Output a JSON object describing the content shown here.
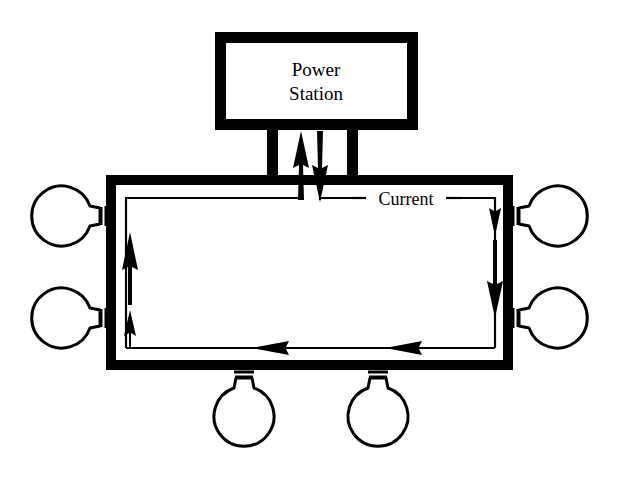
{
  "diagram": {
    "background_color": "#ffffff",
    "ink_color": "#000000",
    "power_station": {
      "label_line1": "Power",
      "label_line2": "Station",
      "box": {
        "x": 215,
        "y": 32,
        "width": 203,
        "height": 98,
        "stroke_width": 11
      }
    },
    "circuit_frame": {
      "name": "main-circuit-loop",
      "x": 106,
      "y": 175,
      "width": 407,
      "height": 195,
      "stroke_width": 10
    },
    "feeders": [
      {
        "name": "left-feeder",
        "x": 272,
        "y_top": 130,
        "y_bottom": 180,
        "width": 10
      },
      {
        "name": "right-feeder",
        "x": 352,
        "y_top": 130,
        "y_bottom": 180,
        "width": 10
      }
    ],
    "current_label": {
      "text": "Current",
      "x": 404,
      "y": 205,
      "leader_left_x1": 352,
      "leader_left_x2": 362,
      "leader_right_x1": 448,
      "leader_right_x2": 462
    },
    "current_path": {
      "inner_left_x": 126,
      "inner_right_x": 495,
      "inner_top_y": 198,
      "inner_bottom_y": 348,
      "supply_up_arrow_x": 301,
      "return_down_arrow_x": 320,
      "supply_arrow_label": "current-out-arrow",
      "return_arrow_label": "current-in-arrow"
    },
    "flow_arrows": [
      {
        "name": "arrow-feed-up",
        "direction": "up",
        "x": 301,
        "y_tail": 200,
        "y_tip": 133
      },
      {
        "name": "arrow-return-down",
        "direction": "down",
        "x": 320,
        "y_tail": 133,
        "y_tip": 200
      },
      {
        "name": "arrow-right-upper",
        "direction": "down",
        "x": 495,
        "y_tail": 198,
        "y_tip": 230
      },
      {
        "name": "arrow-right-lower",
        "direction": "down",
        "x": 495,
        "y_tail": 250,
        "y_tip": 310
      },
      {
        "name": "arrow-bottom-right",
        "direction": "left",
        "y": 348,
        "x_tail": 440,
        "x_tip": 388
      },
      {
        "name": "arrow-bottom-left",
        "direction": "left",
        "y": 348,
        "x_tail": 320,
        "x_tip": 255
      },
      {
        "name": "arrow-left-lower",
        "direction": "up",
        "x": 130,
        "y_tail": 348,
        "y_tip": 313
      },
      {
        "name": "arrow-left-upper",
        "direction": "up",
        "x": 130,
        "y_tail": 295,
        "y_tip": 230
      }
    ],
    "bulbs": [
      {
        "name": "bulb-left-upper",
        "side": "left",
        "cx": 68,
        "cy": 216
      },
      {
        "name": "bulb-left-lower",
        "side": "left",
        "cx": 68,
        "cy": 318
      },
      {
        "name": "bulb-right-upper",
        "side": "right",
        "cx": 552,
        "cy": 216
      },
      {
        "name": "bulb-right-lower",
        "side": "right",
        "cx": 552,
        "cy": 318
      },
      {
        "name": "bulb-bottom-left",
        "side": "bottom",
        "cx": 244,
        "cy": 412
      },
      {
        "name": "bulb-bottom-right",
        "side": "bottom",
        "cx": 378,
        "cy": 412
      }
    ],
    "bulb_count": 6,
    "bulb_geometry": {
      "globe_radius": 30,
      "neck_length": 18,
      "base_length": 14,
      "ridge_count": 3,
      "stroke_width": 3
    }
  }
}
